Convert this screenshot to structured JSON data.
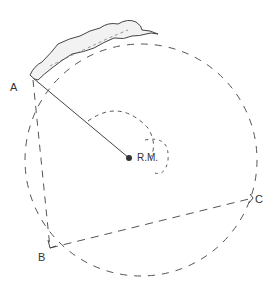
{
  "diagram": {
    "type": "hand-drawn geometry sketch",
    "labels": {
      "a": "A",
      "b": "B",
      "c": "C",
      "center": "R.M."
    },
    "points": {
      "A": [
        33,
        78
      ],
      "B": [
        50,
        248
      ],
      "C": [
        253,
        198
      ],
      "center": [
        129,
        158
      ]
    },
    "colors": {
      "stroke": "#444444",
      "ink": "#333333"
    }
  }
}
